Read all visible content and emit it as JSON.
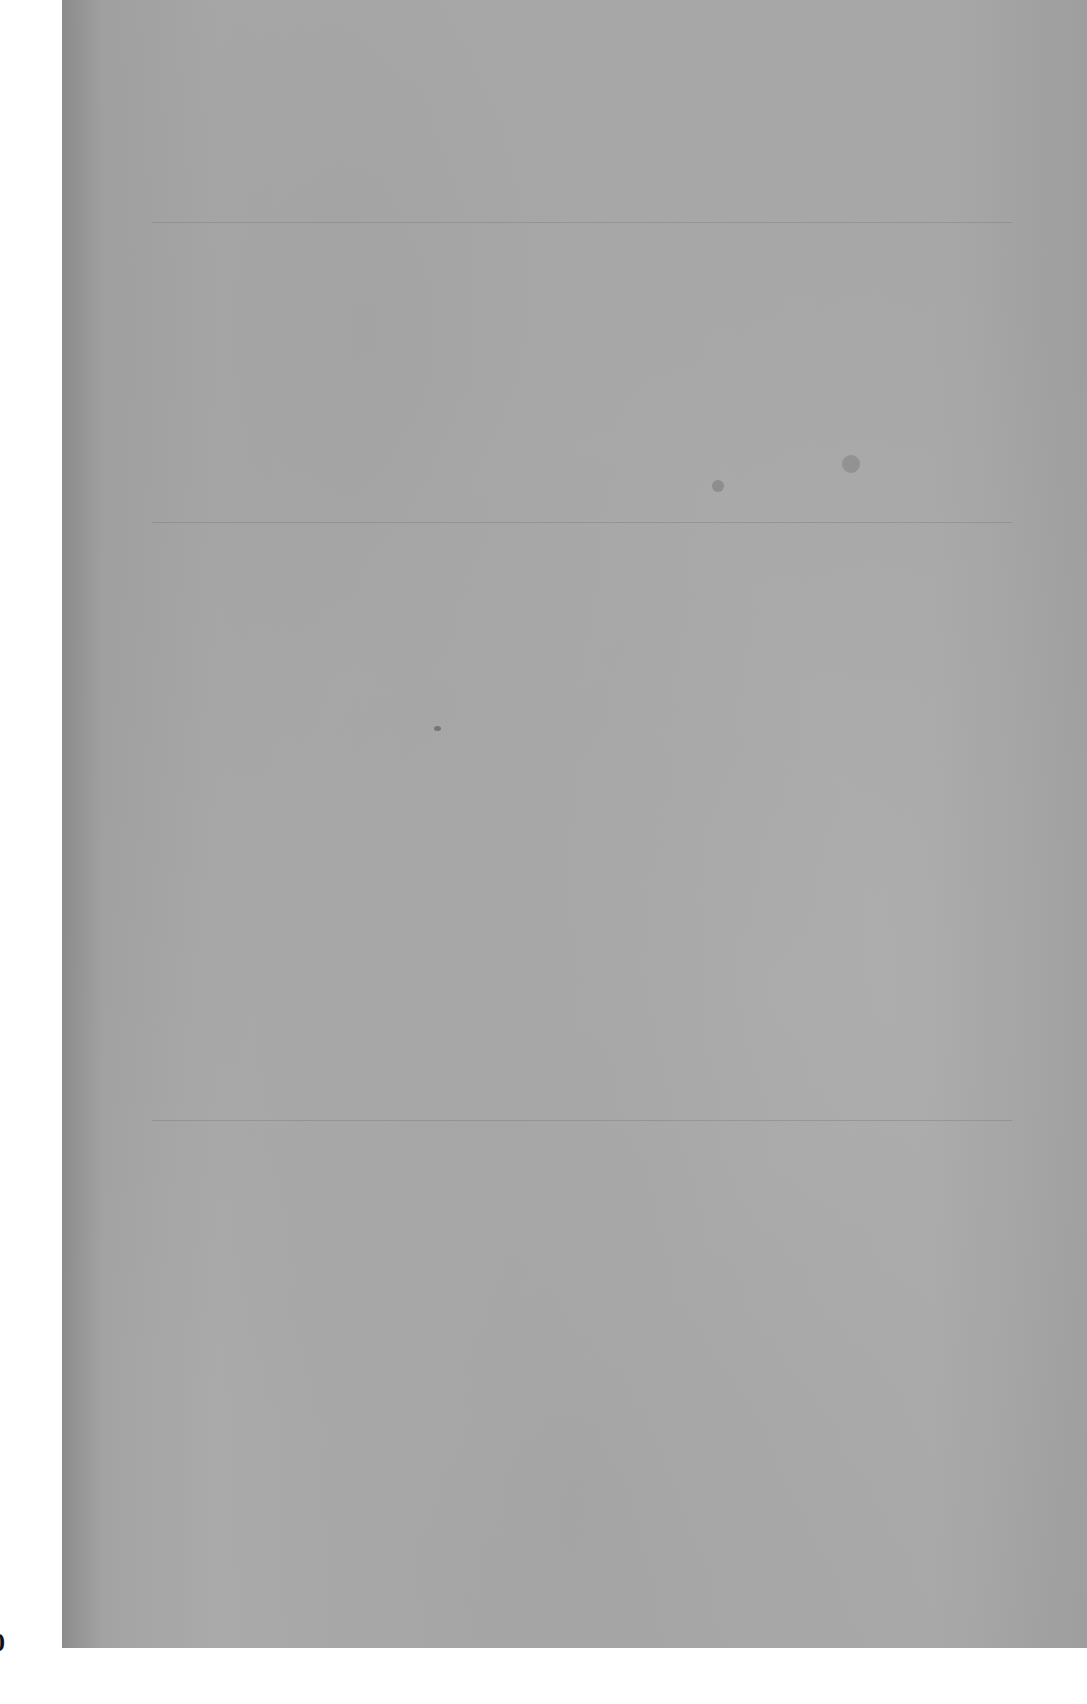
{
  "document": {
    "type": "blank scanned page",
    "edge_mark": "0"
  },
  "colors": {
    "paper": "#acacac",
    "paper_edge": "#8c8c8c",
    "background": "#ffffff"
  }
}
